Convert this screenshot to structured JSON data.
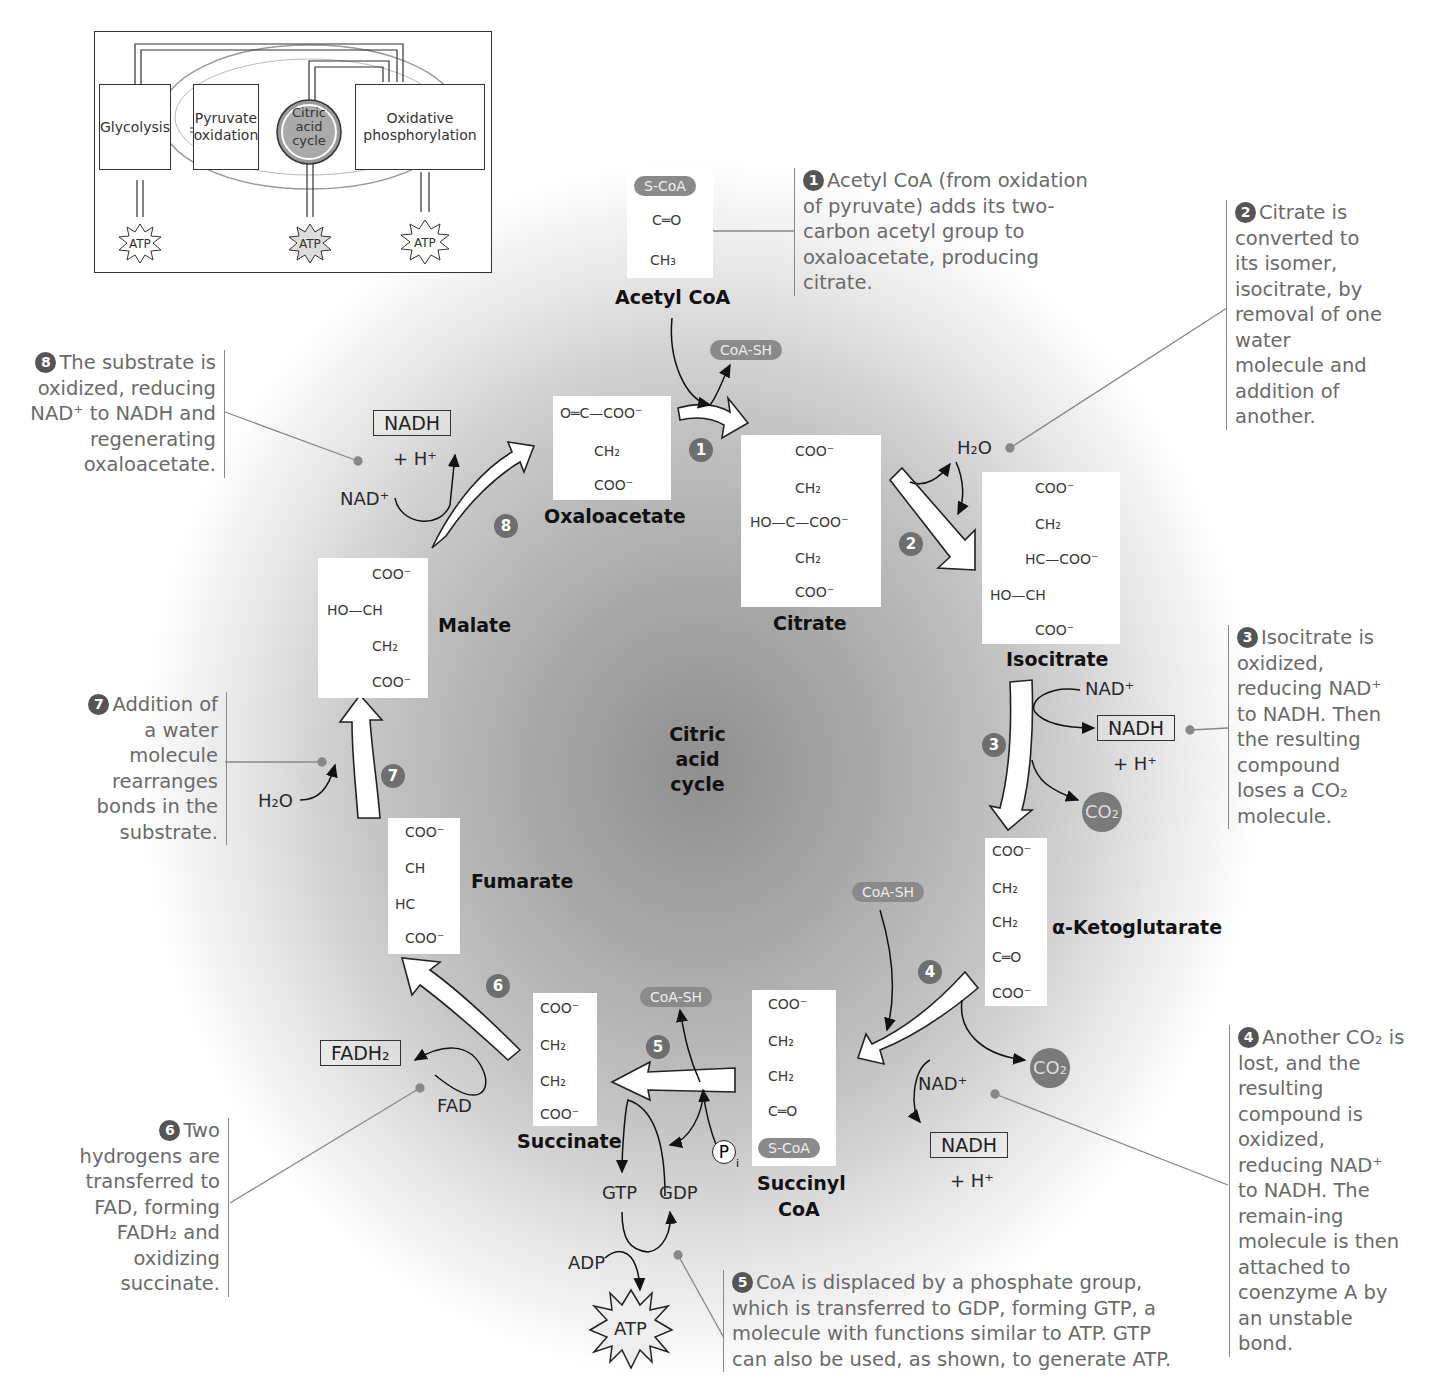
{
  "overview_inset": {
    "stages": [
      "Glycolysis",
      "Pyruvate oxidation",
      "Citric acid cycle",
      "Oxidative phosphorylation"
    ],
    "stage_lines": {
      "glycolysis": "Glycolysis",
      "pyruvate_1": "Pyruvate",
      "pyruvate_2": "oxidation",
      "cac_1": "Citric",
      "cac_2": "acid",
      "cac_3": "cycle",
      "oxphos_1": "Oxidative",
      "oxphos_2": "phosphorylation"
    },
    "atp_labels": [
      "ATP",
      "ATP",
      "ATP"
    ]
  },
  "center_title": {
    "line1": "Citric",
    "line2": "acid",
    "line3": "cycle"
  },
  "molecules": {
    "acetyl_coa": {
      "name": "Acetyl CoA",
      "group": "S-CoA",
      "carbonyl": "C═O",
      "methyl": "CH₃"
    },
    "oxaloacetate": {
      "name": "Oxaloacetate",
      "top": "O═C—COO⁻",
      "mid": "CH₂",
      "bottom": "COO⁻"
    },
    "citrate": {
      "name": "Citrate",
      "l1": "COO⁻",
      "l2": "CH₂",
      "l3": "HO—C—COO⁻",
      "l4": "CH₂",
      "l5": "COO⁻"
    },
    "isocitrate": {
      "name": "Isocitrate",
      "l1": "COO⁻",
      "l2": "CH₂",
      "l3": "HC—COO⁻",
      "l4": "HO—CH",
      "l5": "COO⁻"
    },
    "alpha_ketoglutarate": {
      "name": "α-Ketoglutarate",
      "l1": "COO⁻",
      "l2": "CH₂",
      "l3": "CH₂",
      "l4": "C═O",
      "l5": "COO⁻"
    },
    "succinyl_coa": {
      "name_1": "Succinyl",
      "name_2": "CoA",
      "l1": "COO⁻",
      "l2": "CH₂",
      "l3": "CH₂",
      "l4": "C═O",
      "group": "S-CoA"
    },
    "succinate": {
      "name": "Succinate",
      "l1": "COO⁻",
      "l2": "CH₂",
      "l3": "CH₂",
      "l4": "COO⁻"
    },
    "fumarate": {
      "name": "Fumarate",
      "l1": "COO⁻",
      "l2": "CH",
      "l3": "HC",
      "l4": "COO⁻"
    },
    "malate": {
      "name": "Malate",
      "l1": "COO⁻",
      "l2": "HO—CH",
      "l3": "CH₂",
      "l4": "COO⁻"
    }
  },
  "cofactors": {
    "coa_sh_1": "CoA-SH",
    "coa_sh_4": "CoA-SH",
    "coa_sh_5": "CoA-SH",
    "h2o_2": "H₂O",
    "nad_3": "NAD⁺",
    "nadh_3": "NADH",
    "h_3": "+ H⁺",
    "co2_3": "CO₂",
    "co2_4": "CO₂",
    "nad_4": "NAD⁺",
    "nadh_4": "NADH",
    "h_4": "+ H⁺",
    "pi_5": "P",
    "pi_sub": "i",
    "gtp_5": "GTP",
    "gdp_5": "GDP",
    "adp_5": "ADP",
    "atp_5": "ATP",
    "fadh2_6": "FADH₂",
    "fad_6": "FAD",
    "h2o_7": "H₂O",
    "nad_8": "NAD⁺",
    "nadh_8": "NADH",
    "h_8": "+ H⁺"
  },
  "steps": [
    "1",
    "2",
    "3",
    "4",
    "5",
    "6",
    "7",
    "8"
  ],
  "annotations": [
    {
      "step": "1",
      "text": "Acetyl CoA (from oxidation of pyruvate) adds its two-carbon acetyl group to oxaloacetate, producing citrate."
    },
    {
      "step": "2",
      "text": "Citrate is converted to its isomer, isocitrate, by removal of one water molecule and addition of another."
    },
    {
      "step": "3",
      "text": "Isocitrate is oxidized, reducing NAD⁺ to NADH. Then the resulting compound loses a CO₂ molecule."
    },
    {
      "step": "4",
      "text": "Another CO₂ is lost, and the resulting compound is oxidized, reducing NAD⁺ to NADH. The remain-ing molecule is then attached to coenzyme A by an unstable bond."
    },
    {
      "step": "5",
      "text": "CoA is displaced by a phosphate group, which is transferred to GDP, forming GTP, a molecule with functions similar to ATP. GTP can also be used, as shown, to generate ATP."
    },
    {
      "step": "6",
      "text": "Two hydrogens are transferred to FAD, forming FADH₂ and oxidizing succinate."
    },
    {
      "step": "7",
      "text": "Addition of a water molecule rearranges bonds in the substrate."
    },
    {
      "step": "8",
      "text": "The substrate is oxidized, reducing NAD⁺ to NADH and regenerating oxaloacetate."
    }
  ]
}
